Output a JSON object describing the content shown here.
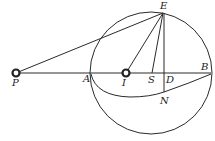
{
  "diagram": {
    "type": "geometry",
    "points": {
      "P": {
        "label": "P",
        "x": 16,
        "y": 73
      },
      "A": {
        "label": "A",
        "x": 91,
        "y": 73
      },
      "I": {
        "label": "I",
        "x": 126,
        "y": 73
      },
      "S": {
        "label": "S",
        "x": 152,
        "y": 73
      },
      "D": {
        "label": "D",
        "x": 164,
        "y": 73
      },
      "B": {
        "label": "B",
        "x": 210,
        "y": 73
      },
      "E": {
        "label": "E",
        "x": 163,
        "y": 13
      },
      "N": {
        "label": "N",
        "x": 164,
        "y": 92
      }
    },
    "circle": {
      "cx": 151,
      "cy": 73,
      "r": 61
    },
    "labels": {
      "P": "P",
      "A": "A",
      "I": "I",
      "S": "S",
      "D": "D",
      "B": "B",
      "E": "E",
      "N": "N"
    }
  }
}
